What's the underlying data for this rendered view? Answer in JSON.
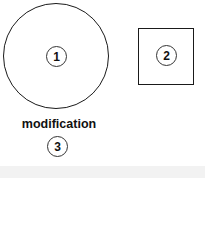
{
  "diagram": {
    "shapes": [
      {
        "type": "circle",
        "badge": "1"
      },
      {
        "type": "square",
        "badge": "2"
      }
    ],
    "label": {
      "text": "modification",
      "badge": "3"
    }
  },
  "colors": {
    "stroke": "#1a1a1a",
    "background": "#ffffff",
    "bottom_band": "#f2f2f2"
  }
}
